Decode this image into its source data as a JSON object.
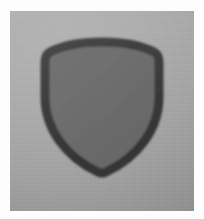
{
  "image": {
    "title": "Shield emblem",
    "alt_text": "Dark gray outlined heraldic shield centered on a flat gray background",
    "width": 204,
    "height": 219,
    "border_color": "#fdfdfd",
    "border_width_px": 10
  },
  "background": {
    "name": "gray-plate",
    "base_color": "#a6a6a6",
    "gradient_from": "#b0b0b0",
    "gradient_to": "#9a9a9a",
    "gradient_angle_deg": 160,
    "texture": "fine-grain-noise"
  },
  "shield": {
    "name": "shield-emblem",
    "style": "outline",
    "outline_color": "#3d3d3d",
    "outline_width_px": 9,
    "fill_color": "#6d6d6d",
    "corner_radius_px": 10,
    "bounds": {
      "left": 35,
      "top": 31,
      "width": 114,
      "height": 131
    },
    "shape_description": "curved top edge with rounded upper corners tapering to a pointed bottom tip",
    "tip_position": {
      "x": 92,
      "y": 162
    }
  },
  "palette": {
    "light_border": "#fdfdfd",
    "background_light": "#b0b0b0",
    "background_dark": "#9a9a9a",
    "shield_stroke": "#3d3d3d",
    "shield_fill": "#6d6d6d"
  }
}
